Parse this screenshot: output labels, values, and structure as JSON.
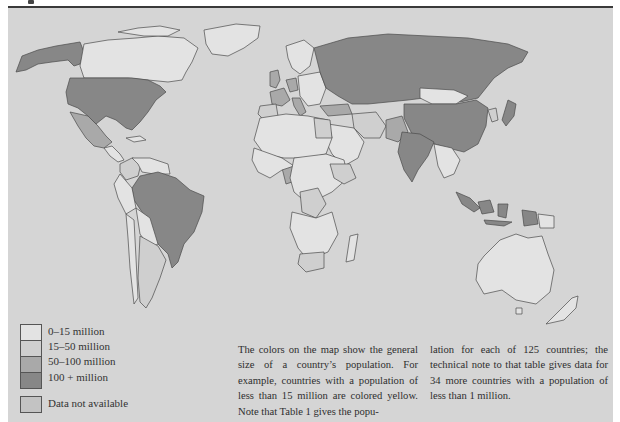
{
  "page": {
    "top_rule": true,
    "panel_color": "#d5d5d5"
  },
  "map": {
    "title": "World population map",
    "categories": [
      {
        "id": "pop_0_15",
        "label": "0–15 million",
        "color": "#e3e3e3"
      },
      {
        "id": "pop_15_50",
        "label": "15–50 million",
        "color": "#cfcfcf"
      },
      {
        "id": "pop_50_100",
        "label": "50–100 million",
        "color": "#a9a9a9"
      },
      {
        "id": "pop_100_plus",
        "label": "100 +  million",
        "color": "#878787"
      },
      {
        "id": "na",
        "label": "Data not available",
        "color": "#c3c3c3"
      }
    ],
    "regions": {
      "pop_100_plus": [
        "United States",
        "Soviet Union",
        "China",
        "India",
        "Brazil",
        "Indonesia",
        "Japan"
      ],
      "pop_50_100": [
        "Mexico",
        "United Kingdom",
        "France",
        "Italy",
        "West Germany",
        "Turkey",
        "Nigeria",
        "Pakistan",
        "Bangladesh"
      ],
      "pop_15_50": [
        "Canada",
        "Argentina",
        "Colombia",
        "Spain",
        "Egypt",
        "Iran",
        "South Africa",
        "Zaire",
        "Ethiopia"
      ],
      "pop_0_15": [
        "Greenland",
        "Australia",
        "New Zealand",
        "Scandinavia",
        "Africa (most)",
        "South America (most)",
        "Middle East (most)"
      ],
      "na": [
        "Alaska"
      ]
    }
  },
  "legend": {
    "items": [
      {
        "label": "0–15 million"
      },
      {
        "label": "15–50 million"
      },
      {
        "label": "50–100 million"
      },
      {
        "label": "100 +  million"
      }
    ],
    "na_label": "Data not available"
  },
  "caption": {
    "col1": "The colors on the map show the general size of a country’s population. For example, countries with a population of less than 15 million are colored yellow. Note that Table 1 gives the popu-",
    "col2": "lation for each of 125 countries; the technical note to that table gives data for 34 more countries with a population of less than 1 million."
  }
}
